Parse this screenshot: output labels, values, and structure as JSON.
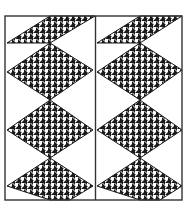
{
  "artwork": {
    "title": "Houndstooth zigzag chevron panels",
    "colors": {
      "background": "#ffffff",
      "ink": "#1a1a1a",
      "border": "#333333"
    },
    "pattern": "houndstooth",
    "panels": [
      {
        "name": "left-panel",
        "x": 5,
        "y": 16,
        "width": 90,
        "height": 184
      },
      {
        "name": "right-panel",
        "x": 96,
        "y": 16,
        "width": 86,
        "height": 184
      }
    ]
  }
}
